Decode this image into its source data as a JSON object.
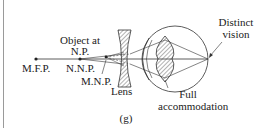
{
  "figure": {
    "caption": "(g)",
    "labels": {
      "object_at_line1": "Object at",
      "object_at_line2": "N.P.",
      "mfp": "M.F.P.",
      "nnp": "N.N.P.",
      "mnp": "M.N.P.",
      "lens": "Lens",
      "distinct_line1": "Distinct",
      "distinct_line2": "vision",
      "full_line1": "Full",
      "full_line2": "accommodation"
    },
    "colors": {
      "line": "#333333",
      "hatch": "#555555",
      "border": "#9a9a9a",
      "background": "#ffffff"
    }
  }
}
